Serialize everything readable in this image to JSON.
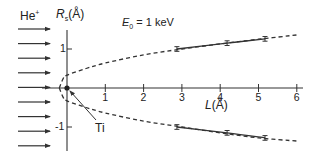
{
  "chart_data": {
    "type": "line",
    "title": "",
    "annotation_energy": {
      "symbol": "E",
      "subscript": "0",
      "text": " = 1 keV"
    },
    "beam_label": {
      "text": "He",
      "superscript": "+"
    },
    "target_label": "Ti",
    "xlabel": {
      "symbol": "L",
      "unit": "(Å)"
    },
    "ylabel": {
      "symbol": "R",
      "subscript": "s",
      "unit": "(Å)"
    },
    "xlim": [
      -0.3,
      6.1
    ],
    "ylim": [
      -1.6,
      1.5
    ],
    "x_ticks": [
      "1",
      "2",
      "3",
      "4",
      "5",
      "6"
    ],
    "y_ticks": [
      "1",
      "-1"
    ],
    "grid": false,
    "legend": null,
    "beam_arrow_count": 9,
    "series": [
      {
        "name": "shadow cone (calculated, dashed)",
        "style": "dashed",
        "x": [
          -0.2,
          -0.1,
          0,
          0.5,
          1,
          2,
          3,
          4,
          5,
          6
        ],
        "upper": [
          0,
          0.24,
          0.33,
          0.5,
          0.64,
          0.85,
          1.0,
          1.13,
          1.25,
          1.36
        ],
        "lower": [
          0,
          -0.24,
          -0.33,
          -0.5,
          -0.64,
          -0.85,
          -1.0,
          -1.15,
          -1.28,
          -1.36
        ]
      },
      {
        "name": "measured (with error bars, solid)",
        "style": "solid+errorbars",
        "x": [
          2.87,
          4.18,
          5.17
        ],
        "upper": [
          1.0,
          1.15,
          1.26
        ],
        "lower": [
          -1.0,
          -1.15,
          -1.28
        ],
        "error": [
          0.06,
          0.06,
          0.06
        ]
      }
    ]
  }
}
